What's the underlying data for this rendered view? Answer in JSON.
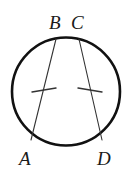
{
  "figure": {
    "type": "circle-with-two-chords",
    "background_color": "#ffffff",
    "stroke_color": "#111111",
    "circle": {
      "name": "circle",
      "center_x": 66,
      "center_y": 91.5,
      "radius": 54,
      "stroke_width": 2.6
    },
    "points": [
      {
        "id": "A",
        "label": "A",
        "x": 31,
        "y": 140
      },
      {
        "id": "B",
        "label": "B",
        "x": 56,
        "y": 39
      },
      {
        "id": "C",
        "label": "C",
        "x": 79,
        "y": 39
      },
      {
        "id": "D",
        "label": "D",
        "x": 102,
        "y": 140
      }
    ],
    "chords": [
      {
        "id": "AB",
        "from": "B",
        "to": "A",
        "x1": 56,
        "y1": 39,
        "x2": 31,
        "y2": 140,
        "stroke_width": 1.1,
        "tick_marks": 1
      },
      {
        "id": "CD",
        "from": "C",
        "to": "D",
        "x1": 79,
        "y1": 39,
        "x2": 102,
        "y2": 140,
        "stroke_width": 1.1,
        "tick_marks": 1
      }
    ],
    "tick_marks": [
      {
        "id": "tick-chord-ab",
        "on_chord": "AB",
        "x1": 32,
        "y1": 92,
        "x2": 56,
        "y2": 88,
        "stroke_width": 1.4
      },
      {
        "id": "tick-chord-cd",
        "on_chord": "CD",
        "x1": 78,
        "y1": 88,
        "x2": 102,
        "y2": 92,
        "stroke_width": 1.4
      }
    ],
    "labels": {
      "A": "A",
      "B": "B",
      "C": "C",
      "D": "D"
    }
  }
}
